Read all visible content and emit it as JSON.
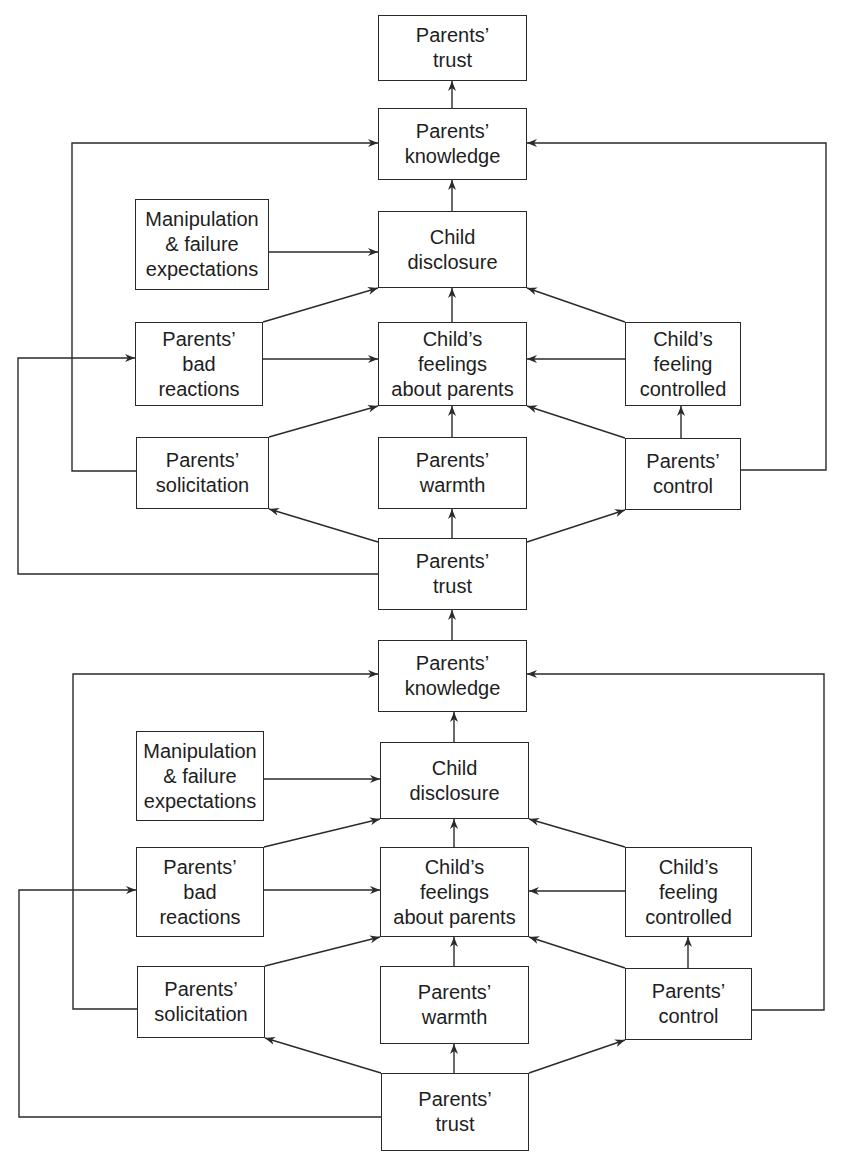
{
  "diagram": {
    "type": "flowchart",
    "description_visible": "Two stacked causal models of parental knowledge",
    "colors": {
      "stroke": "#2a2a2a",
      "text": "#1e1e1e",
      "background": "#ffffff"
    },
    "nodes": [
      {
        "id": "t1_trust_out",
        "label": "Parents’\ntrust",
        "x": 378,
        "y": 15,
        "w": 149,
        "h": 66
      },
      {
        "id": "t1_knowledge",
        "label": "Parents’\nknowledge",
        "x": 378,
        "y": 108,
        "w": 149,
        "h": 72
      },
      {
        "id": "t1_manip",
        "label": "Manipulation\n& failure\nexpectations",
        "x": 135,
        "y": 199,
        "w": 134,
        "h": 91
      },
      {
        "id": "t1_disclosure",
        "label": "Child\ndisclosure",
        "x": 378,
        "y": 211,
        "w": 149,
        "h": 77
      },
      {
        "id": "t1_badreact",
        "label": "Parents’\nbad\nreactions",
        "x": 135,
        "y": 322,
        "w": 128,
        "h": 84
      },
      {
        "id": "t1_feelings",
        "label": "Child’s\nfeelings\nabout parents",
        "x": 378,
        "y": 322,
        "w": 149,
        "h": 84
      },
      {
        "id": "t1_feelctrl",
        "label": "Child’s\nfeeling\ncontrolled",
        "x": 625,
        "y": 322,
        "w": 116,
        "h": 84
      },
      {
        "id": "t1_solicit",
        "label": "Parents’\nsolicitation",
        "x": 136,
        "y": 437,
        "w": 133,
        "h": 72
      },
      {
        "id": "t1_warmth",
        "label": "Parents’\nwarmth",
        "x": 378,
        "y": 437,
        "w": 149,
        "h": 72
      },
      {
        "id": "t1_control",
        "label": "Parents’\ncontrol",
        "x": 625,
        "y": 438,
        "w": 116,
        "h": 72
      },
      {
        "id": "mid_trust",
        "label": "Parents’\ntrust",
        "x": 378,
        "y": 538,
        "w": 149,
        "h": 72
      },
      {
        "id": "b_knowledge",
        "label": "Parents’\nknowledge",
        "x": 378,
        "y": 640,
        "w": 149,
        "h": 72
      },
      {
        "id": "b_manip",
        "label": "Manipulation\n& failure\nexpectations",
        "x": 136,
        "y": 731,
        "w": 128,
        "h": 90
      },
      {
        "id": "b_disclosure",
        "label": "Child\ndisclosure",
        "x": 380,
        "y": 742,
        "w": 149,
        "h": 77
      },
      {
        "id": "b_badreact",
        "label": "Parents’\nbad\nreactions",
        "x": 136,
        "y": 847,
        "w": 128,
        "h": 90
      },
      {
        "id": "b_feelings",
        "label": "Child’s\nfeelings\nabout parents",
        "x": 380,
        "y": 847,
        "w": 149,
        "h": 90
      },
      {
        "id": "b_feelctrl",
        "label": "Child’s\nfeeling\ncontrolled",
        "x": 625,
        "y": 847,
        "w": 127,
        "h": 90
      },
      {
        "id": "b_solicit",
        "label": "Parents’\nsolicitation",
        "x": 137,
        "y": 966,
        "w": 128,
        "h": 72
      },
      {
        "id": "b_warmth",
        "label": "Parents’\nwarmth",
        "x": 380,
        "y": 966,
        "w": 149,
        "h": 78
      },
      {
        "id": "b_control",
        "label": "Parents’\ncontrol",
        "x": 625,
        "y": 968,
        "w": 127,
        "h": 72
      },
      {
        "id": "b_trust",
        "label": "Parents’\ntrust",
        "x": 381,
        "y": 1073,
        "w": 148,
        "h": 78
      }
    ],
    "edges": [
      {
        "from": "t1_knowledge",
        "to": "t1_trust_out",
        "points": [
          [
            452,
            108
          ],
          [
            452,
            81
          ]
        ]
      },
      {
        "from": "t1_disclosure",
        "to": "t1_knowledge",
        "points": [
          [
            452,
            211
          ],
          [
            452,
            180
          ]
        ]
      },
      {
        "from": "t1_manip",
        "to": "t1_disclosure",
        "points": [
          [
            269,
            252
          ],
          [
            378,
            252
          ]
        ]
      },
      {
        "from": "t1_badreact",
        "to": "t1_disclosure",
        "points": [
          [
            263,
            322
          ],
          [
            378,
            288
          ]
        ]
      },
      {
        "from": "t1_feelings",
        "to": "t1_disclosure",
        "points": [
          [
            452,
            322
          ],
          [
            452,
            288
          ]
        ]
      },
      {
        "from": "t1_feelctrl",
        "to": "t1_disclosure",
        "points": [
          [
            625,
            322
          ],
          [
            527,
            288
          ]
        ]
      },
      {
        "from": "t1_badreact",
        "to": "t1_feelings",
        "points": [
          [
            263,
            359
          ],
          [
            378,
            359
          ]
        ]
      },
      {
        "from": "t1_feelctrl",
        "to": "t1_feelings",
        "points": [
          [
            625,
            359
          ],
          [
            527,
            359
          ]
        ]
      },
      {
        "from": "t1_solicit",
        "to": "t1_feelings",
        "points": [
          [
            269,
            437
          ],
          [
            378,
            406
          ]
        ]
      },
      {
        "from": "t1_warmth",
        "to": "t1_feelings",
        "points": [
          [
            452,
            437
          ],
          [
            452,
            406
          ]
        ]
      },
      {
        "from": "t1_control",
        "to": "t1_feelings",
        "points": [
          [
            625,
            438
          ],
          [
            527,
            406
          ]
        ]
      },
      {
        "from": "t1_control",
        "to": "t1_feelctrl",
        "points": [
          [
            681,
            438
          ],
          [
            681,
            406
          ]
        ]
      },
      {
        "from": "mid_trust",
        "to": "t1_solicit",
        "points": [
          [
            378,
            542
          ],
          [
            269,
            509
          ]
        ]
      },
      {
        "from": "mid_trust",
        "to": "t1_warmth",
        "points": [
          [
            452,
            538
          ],
          [
            452,
            509
          ]
        ]
      },
      {
        "from": "mid_trust",
        "to": "t1_control",
        "points": [
          [
            527,
            542
          ],
          [
            625,
            510
          ]
        ]
      },
      {
        "from": "t1_solicit",
        "to": "t1_knowledge",
        "points": [
          [
            136,
            471
          ],
          [
            72,
            471
          ],
          [
            72,
            143
          ],
          [
            378,
            143
          ]
        ]
      },
      {
        "from": "t1_control",
        "to": "t1_knowledge",
        "points": [
          [
            741,
            470
          ],
          [
            826,
            470
          ],
          [
            826,
            143
          ],
          [
            527,
            143
          ]
        ]
      },
      {
        "from": "mid_trust",
        "to": "t1_badreact",
        "points": [
          [
            378,
            574
          ],
          [
            18,
            574
          ],
          [
            18,
            358
          ],
          [
            135,
            358
          ]
        ]
      },
      {
        "from": "b_knowledge",
        "to": "mid_trust",
        "points": [
          [
            452,
            640
          ],
          [
            452,
            610
          ]
        ]
      },
      {
        "from": "b_disclosure",
        "to": "b_knowledge",
        "points": [
          [
            454,
            742
          ],
          [
            454,
            712
          ]
        ]
      },
      {
        "from": "b_manip",
        "to": "b_disclosure",
        "points": [
          [
            264,
            779
          ],
          [
            380,
            779
          ]
        ]
      },
      {
        "from": "b_badreact",
        "to": "b_disclosure",
        "points": [
          [
            264,
            847
          ],
          [
            380,
            819
          ]
        ]
      },
      {
        "from": "b_feelings",
        "to": "b_disclosure",
        "points": [
          [
            454,
            847
          ],
          [
            454,
            819
          ]
        ]
      },
      {
        "from": "b_feelctrl",
        "to": "b_disclosure",
        "points": [
          [
            625,
            847
          ],
          [
            529,
            819
          ]
        ]
      },
      {
        "from": "b_badreact",
        "to": "b_feelings",
        "points": [
          [
            264,
            890
          ],
          [
            380,
            890
          ]
        ]
      },
      {
        "from": "b_feelctrl",
        "to": "b_feelings",
        "points": [
          [
            625,
            891
          ],
          [
            529,
            891
          ]
        ]
      },
      {
        "from": "b_solicit",
        "to": "b_feelings",
        "points": [
          [
            265,
            966
          ],
          [
            380,
            937
          ]
        ]
      },
      {
        "from": "b_warmth",
        "to": "b_feelings",
        "points": [
          [
            454,
            966
          ],
          [
            454,
            937
          ]
        ]
      },
      {
        "from": "b_control",
        "to": "b_feelings",
        "points": [
          [
            625,
            968
          ],
          [
            529,
            937
          ]
        ]
      },
      {
        "from": "b_control",
        "to": "b_feelctrl",
        "points": [
          [
            688,
            968
          ],
          [
            688,
            937
          ]
        ]
      },
      {
        "from": "b_trust",
        "to": "b_solicit",
        "points": [
          [
            381,
            1073
          ],
          [
            265,
            1038
          ]
        ]
      },
      {
        "from": "b_trust",
        "to": "b_warmth",
        "points": [
          [
            454,
            1073
          ],
          [
            454,
            1044
          ]
        ]
      },
      {
        "from": "b_trust",
        "to": "b_control",
        "points": [
          [
            529,
            1073
          ],
          [
            625,
            1040
          ]
        ]
      },
      {
        "from": "b_solicit",
        "to": "b_knowledge",
        "points": [
          [
            137,
            1009
          ],
          [
            73,
            1009
          ],
          [
            73,
            674
          ],
          [
            378,
            674
          ]
        ]
      },
      {
        "from": "b_control",
        "to": "b_knowledge",
        "points": [
          [
            752,
            1010
          ],
          [
            824,
            1010
          ],
          [
            824,
            674
          ],
          [
            527,
            674
          ]
        ]
      },
      {
        "from": "b_trust",
        "to": "b_badreact",
        "points": [
          [
            381,
            1117
          ],
          [
            19,
            1117
          ],
          [
            19,
            890
          ],
          [
            136,
            890
          ]
        ]
      }
    ]
  }
}
